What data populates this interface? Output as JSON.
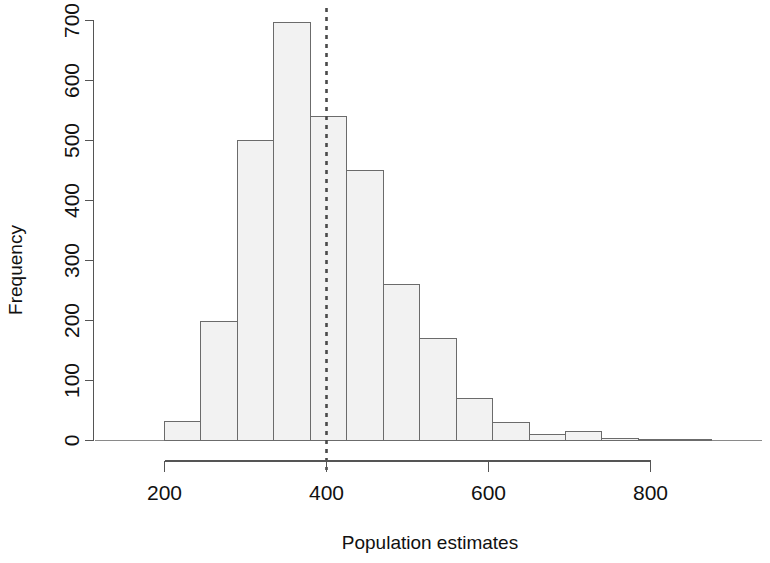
{
  "chart_data": {
    "type": "bar",
    "subtype": "histogram",
    "title": "",
    "xlabel": "Population estimates",
    "ylabel": "Frequency",
    "xlim": [
      160,
      890
    ],
    "ylim": [
      0,
      700
    ],
    "grid": false,
    "legend": null,
    "x_ticks": [
      200,
      400,
      600,
      800
    ],
    "x_tick_labels": [
      "200",
      "400",
      "600",
      "800"
    ],
    "y_ticks": [
      0,
      100,
      200,
      300,
      400,
      500,
      600,
      700
    ],
    "y_tick_labels": [
      "0",
      "100",
      "200",
      "300",
      "400",
      "500",
      "600",
      "700"
    ],
    "bin_width": 45,
    "bin_edges": [
      200,
      245,
      290,
      335,
      380,
      425,
      470,
      515,
      560,
      605,
      650,
      695,
      740,
      785,
      830,
      875
    ],
    "categories": [
      "200-245",
      "245-290",
      "290-335",
      "335-380",
      "380-425",
      "425-470",
      "470-515",
      "515-560",
      "560-605",
      "605-650",
      "650-695",
      "695-740",
      "740-785",
      "785-830",
      "830-875"
    ],
    "values": [
      32,
      198,
      500,
      697,
      540,
      450,
      260,
      170,
      70,
      30,
      10,
      15,
      3,
      2,
      1
    ],
    "annotations": [
      {
        "name": "reference-line",
        "type": "vertical-dashed-line",
        "x": 400,
        "color": "#4a4a4a",
        "style": "dashed"
      }
    ],
    "bar_fill_color": "#f2f2f2",
    "bar_border_color": "#6b6b6b"
  }
}
